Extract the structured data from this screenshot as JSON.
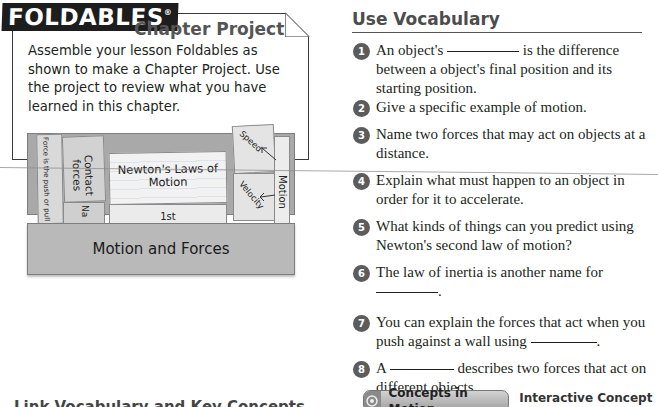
{
  "foldables": {
    "logo": "FOLDABLES",
    "registered_mark": "®",
    "heading": "Chapter Project",
    "instructions": "Assemble your lesson Foldables as shown to make a Chapter Project. Use the project to review what you have learned in this chapter.",
    "illustration": {
      "pocket_label": "Motion and Forces",
      "tabs": {
        "force_definition": "Force is the push or pull",
        "contact_forces": "Contact forces",
        "na_fragment": "Na",
        "newtons_laws": "Newton's Laws of Motion",
        "first": "1st",
        "speed": "Speed",
        "velocity": "Velocity",
        "motion": "Motion"
      }
    }
  },
  "use_vocabulary": {
    "title": "Use Vocabulary",
    "questions": [
      {
        "num": "1",
        "before": "An object's",
        "after": "is the difference between a object's final position and its starting position."
      },
      {
        "num": "2",
        "text": "Give a specific example of motion."
      },
      {
        "num": "3",
        "text": "Name two forces that may act on objects at a distance."
      },
      {
        "num": "4",
        "text": "Explain what must happen to an object in order for it to accelerate."
      },
      {
        "num": "5",
        "text": "What kinds of things can you predict using Newton's second law of motion?"
      },
      {
        "num": "6",
        "text": "The law of inertia is another name for",
        "after": "."
      },
      {
        "num": "7",
        "text": "You can explain the forces that act when you push against a wall using",
        "after": "."
      },
      {
        "num": "8",
        "before": "A",
        "after": "describes two forces that act on different objects."
      }
    ]
  },
  "concepts_in_motion": {
    "button_label": "Concepts in Motion",
    "link_label": "Interactive Concept Map"
  },
  "bottom_heading": "Link Vocabulary and Key Concepts"
}
